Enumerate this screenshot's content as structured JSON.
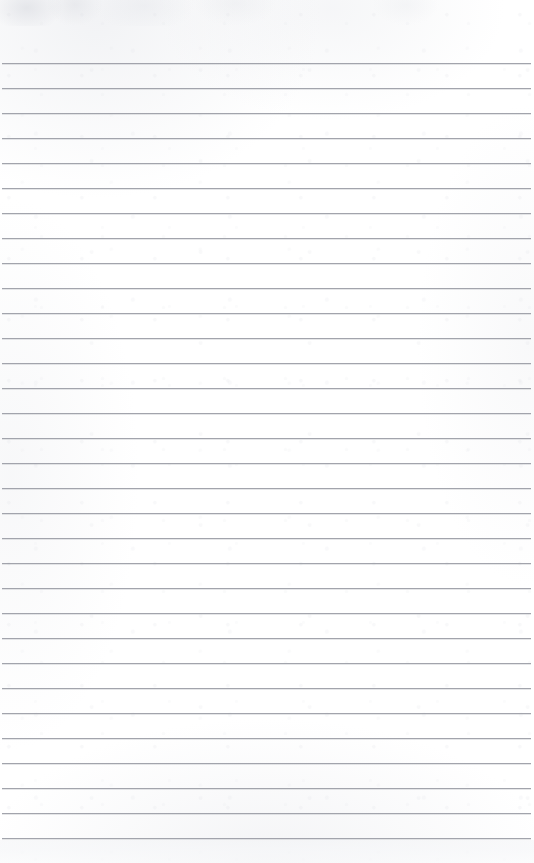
{
  "document": {
    "kind": "ruled-notebook-paper",
    "title": "Blank Lined Paper",
    "content_text": "",
    "has_handwriting": false,
    "has_printed_text": false
  },
  "canvas": {
    "width": 534,
    "height": 863,
    "background_color": "#fefefe",
    "paper_tint": "#ffffff"
  },
  "ruling": {
    "line_color": "#9b9da6",
    "line_thickness_px": 1,
    "line_spacing_px": 25,
    "first_line_y": 63,
    "last_line_y": 838,
    "line_count": 32,
    "line_start_x": 2,
    "line_end_x": 531,
    "top_margin_px": 63,
    "left_margin_px": 2,
    "right_margin_px": 3,
    "margin_rule": "none",
    "lines_y": [
      63,
      88,
      113,
      138,
      163,
      188,
      213,
      238,
      263,
      288,
      313,
      338,
      363,
      388,
      413,
      438,
      463,
      488,
      513,
      538,
      563,
      588,
      613,
      638,
      663,
      688,
      713,
      738,
      763,
      788,
      813,
      838
    ]
  },
  "artifacts": {
    "top_smudge_band": {
      "y": 0,
      "height": 26,
      "color": "#dcdee4"
    },
    "bottom_gray_band": {
      "y": 840,
      "height": 23,
      "color": "#f4f5f7"
    },
    "texture_color": "#d9dbe1"
  }
}
